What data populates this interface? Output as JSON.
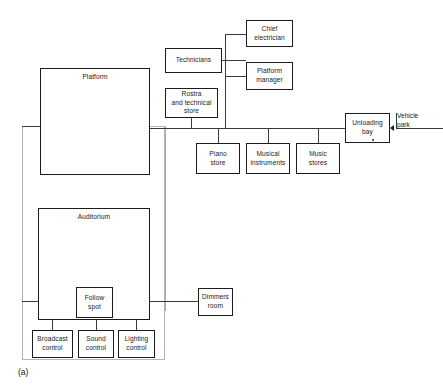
{
  "figure": {
    "caption": "(a)",
    "type": "block-relationship-diagram"
  },
  "nodes": {
    "platform": {
      "label": "Platform"
    },
    "technicians": {
      "label": "Technicians"
    },
    "rostra_store": {
      "label": "Rostra\nand technical\nstore"
    },
    "chief_electrician": {
      "label": "Chief\nelectrician"
    },
    "platform_manager": {
      "label": "Platform\nmanager"
    },
    "piano_store": {
      "label": "Piano\nstore"
    },
    "musical_instruments": {
      "label": "Musical\ninstruments"
    },
    "music_stores": {
      "label": "Music\nstores"
    },
    "unloading_bay": {
      "label": "Unloading\nbay"
    },
    "auditorium": {
      "label": "Auditorium"
    },
    "follow_spot": {
      "label": "Follow\nspot"
    },
    "dimmers_room": {
      "label": "Dimmers\nroom"
    },
    "broadcast_control": {
      "label": "Broadcast\ncontrol"
    },
    "sound_control": {
      "label": "Sound\ncontrol"
    },
    "lighting_control": {
      "label": "Lighting\ncontrol"
    }
  },
  "labels": {
    "vehicle_park": "Vehicle\npark"
  },
  "colors": {
    "box_stroke": "#1c1c1c",
    "connector_stroke": "#3a3a3a",
    "enclosure_stroke": "#b4b4b4",
    "background": "#ffffff",
    "text": "#1a1a1a"
  }
}
